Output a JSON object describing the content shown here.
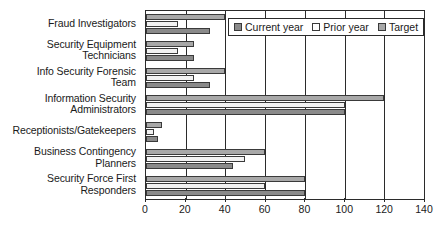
{
  "chart_data": {
    "type": "bar",
    "orientation": "horizontal",
    "title": "",
    "xlabel": "",
    "ylabel": "",
    "xlim": [
      0,
      140
    ],
    "xticks": [
      0,
      20,
      40,
      60,
      80,
      100,
      120,
      140
    ],
    "grid": true,
    "legend_position": "top-right-inside",
    "categories": [
      "Fraud Investigators",
      "Security Equipment Technicians",
      "Info Security Forensic Team",
      "Information Security Administrators",
      "Receptionists/Gatekeepers",
      "Business Contingency Planners",
      "Security Force First Responders"
    ],
    "category_lines": [
      [
        "Fraud Investigators"
      ],
      [
        "Security Equipment",
        "Technicians"
      ],
      [
        "Info Security Forensic",
        "Team"
      ],
      [
        "Information Security",
        "Administrators"
      ],
      [
        "Receptionists/Gatekeepers"
      ],
      [
        "Business Contingency",
        "Planners"
      ],
      [
        "Security Force First",
        "Responders"
      ]
    ],
    "series": [
      {
        "name": "Current year",
        "key": "current",
        "color": "#8a8a8a",
        "values": [
          32,
          24,
          32,
          100,
          6,
          44,
          80
        ]
      },
      {
        "name": "Prior year",
        "key": "prior",
        "color": "#f2f2f2",
        "values": [
          16,
          16,
          24,
          100,
          4,
          50,
          60
        ]
      },
      {
        "name": "Target",
        "key": "target",
        "color": "#a8a8a8",
        "values": [
          40,
          24,
          40,
          120,
          8,
          60,
          80
        ]
      }
    ],
    "bar_draw_order": [
      "target",
      "prior",
      "current"
    ]
  },
  "legend": {
    "items": [
      {
        "label": "Current year",
        "key": "current"
      },
      {
        "label": "Prior year",
        "key": "prior"
      },
      {
        "label": "Target",
        "key": "target"
      }
    ]
  },
  "axis": {
    "tick_labels": [
      "0",
      "20",
      "40",
      "60",
      "80",
      "100",
      "120",
      "140"
    ]
  },
  "colors": {
    "current_year": "#8a8a8a",
    "prior_year": "#f2f2f2",
    "target": "#a8a8a8",
    "axis": "#2b2b2b",
    "background": "#ffffff"
  }
}
